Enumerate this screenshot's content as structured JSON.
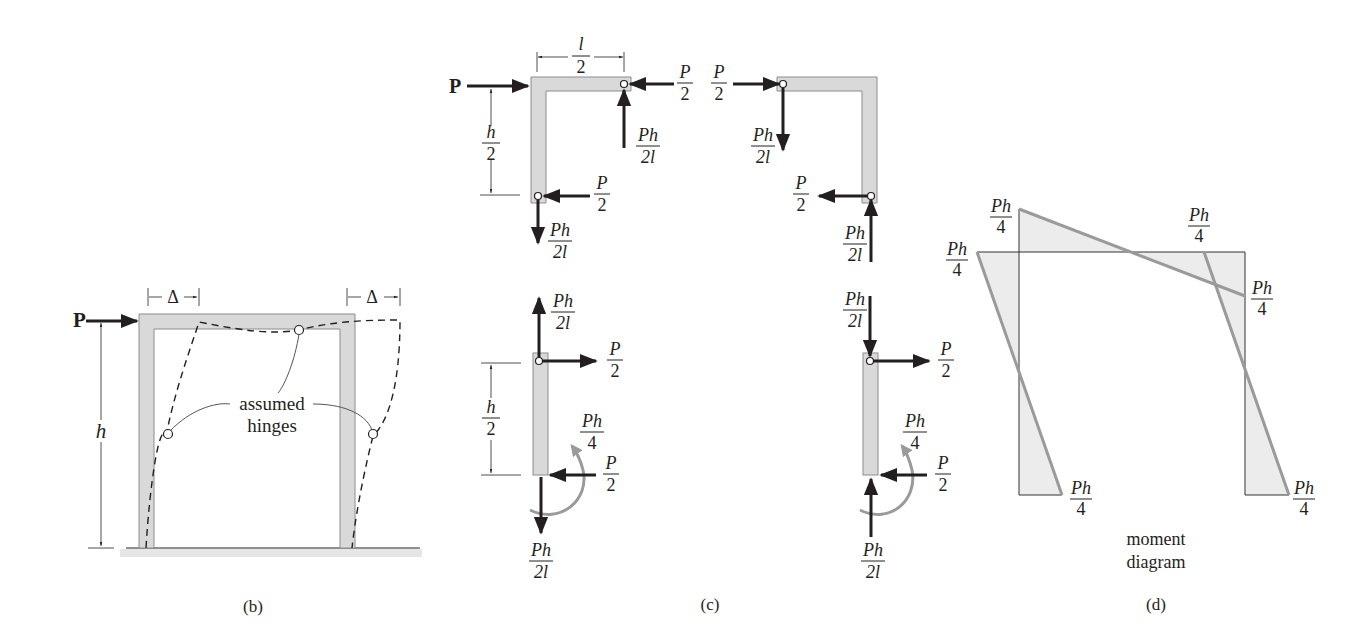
{
  "figure": {
    "panels": [
      {
        "id": "b",
        "caption": "(b)",
        "load_label": "P",
        "height_label": "h",
        "sway_label_left": "Δ",
        "sway_label_right": "Δ",
        "annotation_line1": "assumed",
        "annotation_line2": "hinges"
      },
      {
        "id": "c",
        "caption": "(c)",
        "top_left": {
          "load_label": "P",
          "width_num": "l",
          "width_den": "2",
          "height_num": "h",
          "height_den": "2",
          "hinge_right_h_num": "P",
          "hinge_right_h_den": "2",
          "hinge_right_v_num": "Ph",
          "hinge_right_v_den": "2l",
          "hinge_bottom_h_num": "P",
          "hinge_bottom_h_den": "2",
          "hinge_bottom_v_num": "Ph",
          "hinge_bottom_v_den": "2l"
        },
        "top_right": {
          "hinge_left_h_num": "P",
          "hinge_left_h_den": "2",
          "hinge_left_v_num": "Ph",
          "hinge_left_v_den": "2l",
          "hinge_bottom_h_num": "P",
          "hinge_bottom_h_den": "2",
          "hinge_bottom_v_num": "Ph",
          "hinge_bottom_v_den": "2l"
        },
        "bottom_left": {
          "top_v_num": "Ph",
          "top_v_den": "2l",
          "top_h_num": "P",
          "top_h_den": "2",
          "height_num": "h",
          "height_den": "2",
          "moment_num": "Ph",
          "moment_den": "4",
          "base_h_num": "P",
          "base_h_den": "2",
          "base_v_num": "Ph",
          "base_v_den": "2l"
        },
        "bottom_right": {
          "top_v_num": "Ph",
          "top_v_den": "2l",
          "top_h_num": "P",
          "top_h_den": "2",
          "moment_num": "Ph",
          "moment_den": "4",
          "base_h_num": "P",
          "base_h_den": "2",
          "base_v_num": "Ph",
          "base_v_den": "2l"
        }
      },
      {
        "id": "d",
        "caption": "(d)",
        "title_line1": "moment",
        "title_line2": "diagram",
        "values": [
          {
            "num": "Ph",
            "den": "4"
          },
          {
            "num": "Ph",
            "den": "4"
          },
          {
            "num": "Ph",
            "den": "4"
          },
          {
            "num": "Ph",
            "den": "4"
          },
          {
            "num": "Ph",
            "den": "4"
          },
          {
            "num": "Ph",
            "den": "4"
          }
        ]
      }
    ]
  },
  "colors": {
    "member_fill": "#d9d9d9",
    "moment_line": "#9a9a9a",
    "moment_fill": "#ececec",
    "ink": "#231f20"
  }
}
